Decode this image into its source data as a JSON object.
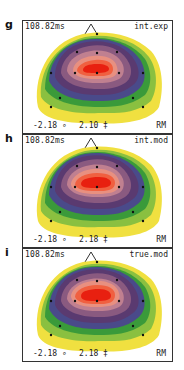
{
  "panels": [
    {
      "label": "g",
      "time": "108.82ms",
      "condition": "int.exp",
      "min": "-2.18 ∘",
      "max": "2.10 ‡",
      "ref": "RM"
    },
    {
      "label": "h",
      "time": "108.82ms",
      "condition": "int.mod",
      "min": "-2.18 ∘",
      "max": "2.18 ‡",
      "ref": "RM"
    },
    {
      "label": "i",
      "time": "108.82ms",
      "condition": "true.mod",
      "min": "-2.18 ∘",
      "max": "2.18 ‡",
      "ref": "RM"
    }
  ],
  "colors": {
    "max_red": "#e82010",
    "orange": "#f06040",
    "salmon": "#e89080",
    "pink": "#c08090",
    "mauve": "#8a5a80",
    "purple": "#5a3a70",
    "blue_purple": "#4a4a8a",
    "teal": "#4a7a6a",
    "green": "#3a9a3a",
    "light_green": "#8ac040",
    "yellow": "#f0e040",
    "electrode": "#111111"
  }
}
